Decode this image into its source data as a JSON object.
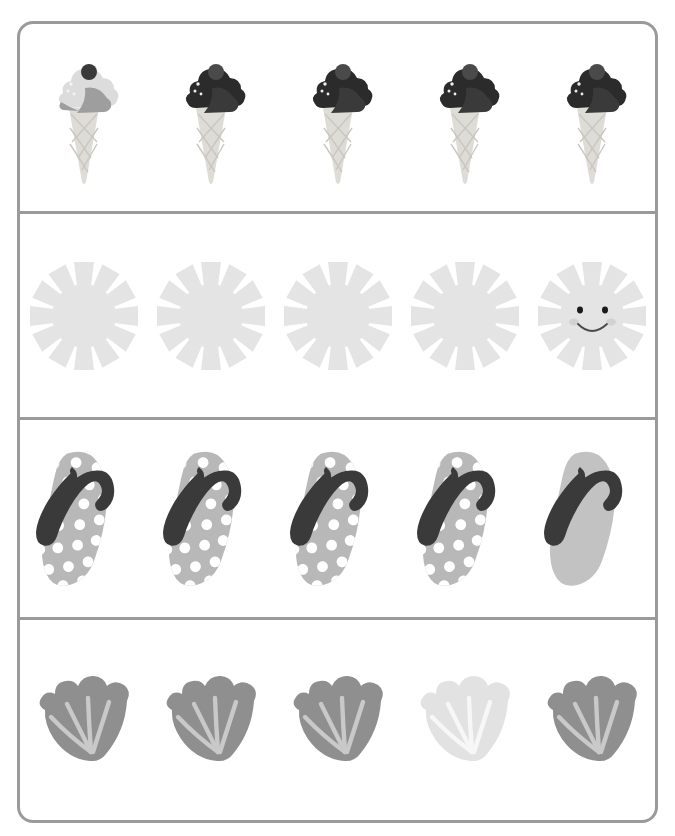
{
  "worksheet": {
    "title": "Odd One Out - Summer Items",
    "type": "find-the-different-one",
    "frame_color": "#9a9a9a",
    "background_color": "#ffffff",
    "rows": [
      {
        "id": "row-icecream",
        "label": "Ice cream cones",
        "item_count": 5,
        "odd_one_out_index": 0,
        "items": [
          {
            "name": "ice-cream-cone",
            "variant": "light-scoop",
            "scoop_color": "#dcdcdc",
            "scoop_shade_color": "#9e9e9e",
            "topping_color": "#3a3a3a",
            "cone_color": "#dedcd6",
            "speckle_color": "#f2f2f2",
            "is_odd": true
          },
          {
            "name": "ice-cream-cone",
            "variant": "dark-scoop",
            "scoop_color": "#2b2b2b",
            "scoop_shade_color": "#4e4e4e",
            "topping_color": "#4a4a4a",
            "cone_color": "#dedcd6",
            "speckle_color": "#efefef",
            "is_odd": false
          },
          {
            "name": "ice-cream-cone",
            "variant": "dark-scoop",
            "scoop_color": "#2b2b2b",
            "scoop_shade_color": "#4e4e4e",
            "topping_color": "#4a4a4a",
            "cone_color": "#dedcd6",
            "speckle_color": "#efefef",
            "is_odd": false
          },
          {
            "name": "ice-cream-cone",
            "variant": "dark-scoop",
            "scoop_color": "#2b2b2b",
            "scoop_shade_color": "#4e4e4e",
            "topping_color": "#4a4a4a",
            "cone_color": "#dedcd6",
            "speckle_color": "#efefef",
            "is_odd": false
          },
          {
            "name": "ice-cream-cone",
            "variant": "dark-scoop",
            "scoop_color": "#2b2b2b",
            "scoop_shade_color": "#4e4e4e",
            "topping_color": "#4a4a4a",
            "cone_color": "#dedcd6",
            "speckle_color": "#efefef",
            "is_odd": false
          }
        ]
      },
      {
        "id": "row-sun",
        "label": "Suns",
        "item_count": 5,
        "odd_one_out_index": 4,
        "items": [
          {
            "name": "sun",
            "variant": "plain",
            "body_color": "#e4e4e4",
            "ray_count": 12,
            "has_face": false,
            "is_odd": false
          },
          {
            "name": "sun",
            "variant": "plain",
            "body_color": "#e4e4e4",
            "ray_count": 12,
            "has_face": false,
            "is_odd": false
          },
          {
            "name": "sun",
            "variant": "plain",
            "body_color": "#e4e4e4",
            "ray_count": 12,
            "has_face": false,
            "is_odd": false
          },
          {
            "name": "sun",
            "variant": "plain",
            "body_color": "#e4e4e4",
            "ray_count": 12,
            "has_face": false,
            "is_odd": false
          },
          {
            "name": "sun",
            "variant": "smiling-face",
            "body_color": "#e4e4e4",
            "ray_count": 12,
            "has_face": true,
            "eye_color": "#1a1a1a",
            "cheek_color": "#d2d2d2",
            "mouth_color": "#4a4a4a",
            "is_odd": true
          }
        ]
      },
      {
        "id": "row-flipflop",
        "label": "Flip flops",
        "item_count": 5,
        "odd_one_out_index": 4,
        "items": [
          {
            "name": "flip-flop",
            "variant": "polka-dot",
            "sole_color": "#b8b8b8",
            "dot_color": "#ffffff",
            "strap_color": "#3a3a3a",
            "has_dots": true,
            "is_odd": false
          },
          {
            "name": "flip-flop",
            "variant": "polka-dot",
            "sole_color": "#b8b8b8",
            "dot_color": "#ffffff",
            "strap_color": "#3a3a3a",
            "has_dots": true,
            "is_odd": false
          },
          {
            "name": "flip-flop",
            "variant": "polka-dot",
            "sole_color": "#b8b8b8",
            "dot_color": "#ffffff",
            "strap_color": "#3a3a3a",
            "has_dots": true,
            "is_odd": false
          },
          {
            "name": "flip-flop",
            "variant": "polka-dot",
            "sole_color": "#b8b8b8",
            "dot_color": "#ffffff",
            "strap_color": "#3a3a3a",
            "has_dots": true,
            "is_odd": false
          },
          {
            "name": "flip-flop",
            "variant": "plain",
            "sole_color": "#c2c2c2",
            "dot_color": "#ffffff",
            "strap_color": "#3a3a3a",
            "has_dots": false,
            "is_odd": true
          }
        ]
      },
      {
        "id": "row-shell",
        "label": "Sea shells",
        "item_count": 5,
        "odd_one_out_index": 3,
        "items": [
          {
            "name": "sea-shell",
            "variant": "dark",
            "body_color": "#8f8f8f",
            "ridge_color": "#c9c9c9",
            "is_odd": false
          },
          {
            "name": "sea-shell",
            "variant": "dark",
            "body_color": "#8f8f8f",
            "ridge_color": "#c9c9c9",
            "is_odd": false
          },
          {
            "name": "sea-shell",
            "variant": "dark",
            "body_color": "#8f8f8f",
            "ridge_color": "#c9c9c9",
            "is_odd": false
          },
          {
            "name": "sea-shell",
            "variant": "light",
            "body_color": "#e2e2e2",
            "ridge_color": "#f7f7f7",
            "is_odd": true
          },
          {
            "name": "sea-shell",
            "variant": "dark",
            "body_color": "#8f8f8f",
            "ridge_color": "#c9c9c9",
            "is_odd": false
          }
        ]
      }
    ]
  }
}
